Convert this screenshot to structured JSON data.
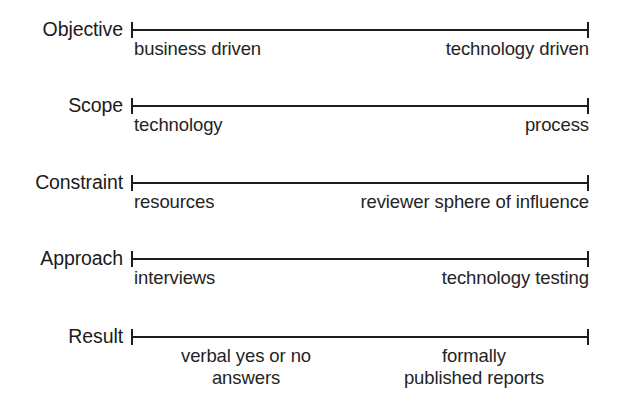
{
  "figure": {
    "type": "spectrum-diagram",
    "background_color": "#ffffff",
    "line_color": "#1d1d1d",
    "text_color": "#1b1b1b",
    "axis": {
      "left_x": 131,
      "right_x": 589,
      "cap_height": 16,
      "line_thickness": 2
    }
  },
  "rows": [
    {
      "name": "objective",
      "label": "Objective",
      "axis_y": 30,
      "left_end": "business driven",
      "right_end": "technology driven",
      "left_align": "left",
      "right_align": "right"
    },
    {
      "name": "scope",
      "label": "Scope",
      "axis_y": 106,
      "left_end": "technology",
      "right_end": "process",
      "left_align": "left",
      "right_align": "right"
    },
    {
      "name": "constraint",
      "label": "Constraint",
      "axis_y": 183,
      "left_end": "resources",
      "right_end": "reviewer sphere of influence",
      "left_align": "left",
      "right_align": "right"
    },
    {
      "name": "approach",
      "label": "Approach",
      "axis_y": 259,
      "left_end": "interviews",
      "right_end": "technology testing",
      "left_align": "left",
      "right_align": "right"
    },
    {
      "name": "result",
      "label": "Result",
      "axis_y": 337,
      "left_end": "verbal yes or no\nanswers",
      "right_end": "formally\npublished reports",
      "left_align": "center",
      "right_align": "center"
    }
  ],
  "chart_data": {
    "type": "table",
    "title": "",
    "xlabel": "",
    "ylabel": "",
    "categories": [
      "Objective",
      "Scope",
      "Constraint",
      "Approach",
      "Result"
    ],
    "series": [
      {
        "name": "left pole",
        "values": [
          "business driven",
          "technology",
          "resources",
          "interviews",
          "verbal yes or no answers"
        ]
      },
      {
        "name": "right pole",
        "values": [
          "technology driven",
          "process",
          "reviewer sphere of influence",
          "technology testing",
          "formally published reports"
        ]
      }
    ],
    "grid": false,
    "legend": "none"
  }
}
